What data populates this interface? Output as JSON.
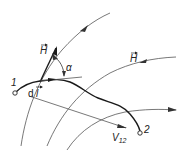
{
  "diagram": {
    "labels": {
      "H_tangent": "H",
      "H_field": "H",
      "alpha": "α",
      "point1": "1",
      "point2": "2",
      "dl": "d l",
      "dl_d": "d",
      "dl_l": "l",
      "V12_main": "V",
      "V12_sub": "12"
    },
    "colors": {
      "line": "#444444",
      "thick": "#1a1a1a",
      "background": "#ffffff"
    }
  }
}
